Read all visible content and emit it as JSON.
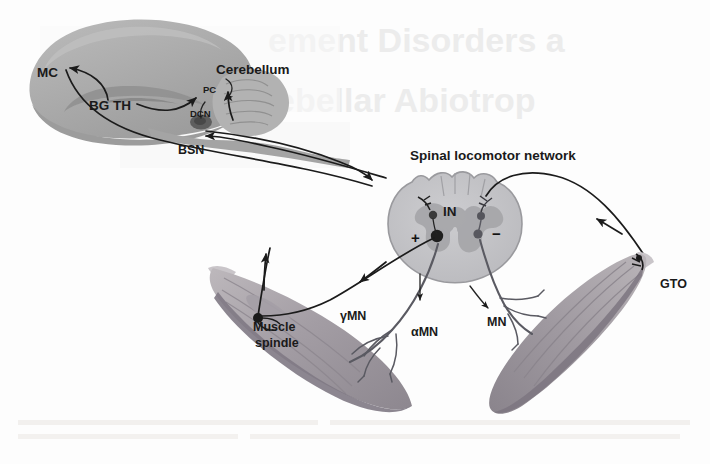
{
  "figure": {
    "caption_title": "Sensorimotor control loop: cortico-cerebellar and spinal locomotor network",
    "background_bleed": {
      "line1": "ement Disorders a",
      "line2": "ebellar Abiotrop",
      "footer": "illegible scanned body text"
    }
  },
  "labels": {
    "motor_cortex": "MC",
    "basal_ganglia_thalamus": "BG TH",
    "cerebellum": "Cerebellum",
    "purkinje_cell": "PC",
    "deep_cerebellar_nuclei": "DCN",
    "brainstem_nuclei": "BSN",
    "spinal_network": "Spinal locomotor network",
    "interneuron": "IN",
    "excitatory_sign": "+",
    "inhibitory_sign": "−",
    "gamma_motor_neuron": "γMN",
    "alpha_motor_neuron": "αMN",
    "motor_neuron": "MN",
    "muscle_spindle_line1": "Muscle",
    "muscle_spindle_line2": "spindle",
    "golgi_tendon_organ": "GTO"
  },
  "colors": {
    "page_background": "#fdfdfd",
    "brain_fill": "#a9a9a9",
    "brain_fill_light": "#bdbdbd",
    "brain_fill_dark": "#969696",
    "cerebellum_fill": "#b2b2b2",
    "brainstem_nucleus": "#5e5e5e",
    "cord_white_matter": "#c2c2c4",
    "cord_grey_matter": "#a6a6aa",
    "muscle_light": "#b5b0b4",
    "muscle_mid": "#9b959c",
    "muscle_dark": "#8a848d",
    "tendon": "#c9c5c9",
    "tract_stroke": "#1b1b1b",
    "nerve_stroke": "#5a5a62",
    "label_text": "#1a1a1a",
    "bleed_text": "#ececec"
  }
}
